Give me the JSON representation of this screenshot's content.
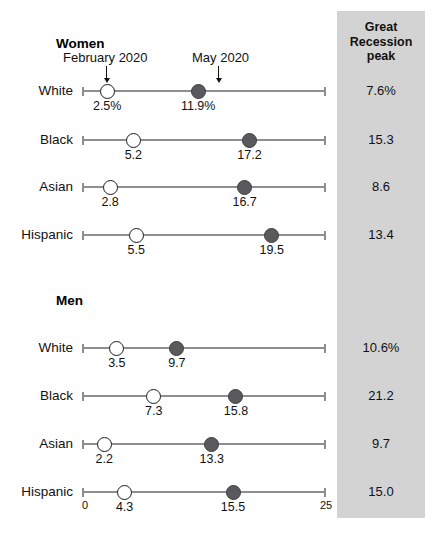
{
  "chart_data": {
    "type": "scatter",
    "subtype": "dumbbell",
    "title": "",
    "xlabel": "",
    "ylabel": "",
    "xlim": [
      0,
      25
    ],
    "x_ticks": [
      "0",
      "25"
    ],
    "grid": false,
    "legend_position": "top-inline-callout",
    "series": [
      {
        "name": "February 2020",
        "marker": "open-circle"
      },
      {
        "name": "May 2020",
        "marker": "filled-circle"
      }
    ],
    "extra_column": {
      "header": "Great Recession peak",
      "header_lines": [
        "Great",
        "Recession",
        "peak"
      ]
    },
    "groups": [
      {
        "name": "Women",
        "rows": [
          {
            "category": "White",
            "feb_2020": 2.5,
            "may_2020": 11.9,
            "feb_label": "2.5%",
            "may_label": "11.9%",
            "recession_peak": "7.6%"
          },
          {
            "category": "Black",
            "feb_2020": 5.2,
            "may_2020": 17.2,
            "feb_label": "5.2",
            "may_label": "17.2",
            "recession_peak": "15.3"
          },
          {
            "category": "Asian",
            "feb_2020": 2.8,
            "may_2020": 16.7,
            "feb_label": "2.8",
            "may_label": "16.7",
            "recession_peak": "8.6"
          },
          {
            "category": "Hispanic",
            "feb_2020": 5.5,
            "may_2020": 19.5,
            "feb_label": "5.5",
            "may_label": "19.5",
            "recession_peak": "13.4"
          }
        ]
      },
      {
        "name": "Men",
        "rows": [
          {
            "category": "White",
            "feb_2020": 3.5,
            "may_2020": 9.7,
            "feb_label": "3.5",
            "may_label": "9.7",
            "recession_peak": "10.6%"
          },
          {
            "category": "Black",
            "feb_2020": 7.3,
            "may_2020": 15.8,
            "feb_label": "7.3",
            "may_label": "15.8",
            "recession_peak": "21.2"
          },
          {
            "category": "Asian",
            "feb_2020": 2.2,
            "may_2020": 13.3,
            "feb_label": "2.2",
            "may_label": "13.3",
            "recession_peak": "9.7"
          },
          {
            "category": "Hispanic",
            "feb_2020": 4.3,
            "may_2020": 15.5,
            "feb_label": "4.3",
            "may_label": "15.5",
            "recession_peak": "15.0"
          }
        ]
      }
    ]
  },
  "colors": {
    "panel_gray": "#d3d3d3",
    "axis_gray": "#8e8e8e",
    "marker_filled": "#5a5a5c",
    "marker_open": "#ffffff",
    "text": "#111111"
  },
  "annotations": {
    "feb_callout": "February 2020",
    "may_callout": "May 2020"
  },
  "axis": {
    "tick_min": "0",
    "tick_max": "25"
  }
}
